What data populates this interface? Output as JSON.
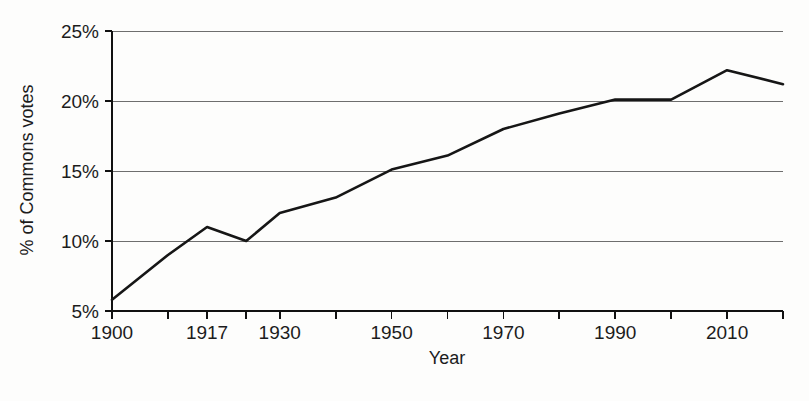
{
  "chart_data": {
    "type": "line",
    "title": "",
    "xlabel": "Year",
    "ylabel": "% of Commons votes",
    "xlim": [
      1900,
      2020
    ],
    "ylim": [
      5,
      25
    ],
    "grid": true,
    "legend": "none",
    "y_ticks": [
      5,
      10,
      15,
      20,
      25
    ],
    "y_tick_labels": [
      "5%",
      "10%",
      "15%",
      "20%",
      "25%"
    ],
    "x_ticks": [
      1900,
      1910,
      1917,
      1924,
      1930,
      1940,
      1950,
      1960,
      1970,
      1980,
      1990,
      2000,
      2010,
      2020
    ],
    "x_tick_labels": [
      "1900",
      "",
      "1917",
      "",
      "1930",
      "",
      "1950",
      "",
      "1970",
      "",
      "1990",
      "",
      "2010",
      ""
    ],
    "x_labeled_ticks": [
      "1900",
      "1917",
      "1930",
      "1950",
      "1970",
      "1990",
      "2010"
    ],
    "series": [
      {
        "name": "% of Commons votes",
        "color": "#161616",
        "x": [
          1900,
          1910,
          1917,
          1924,
          1930,
          1940,
          1950,
          1960,
          1970,
          1980,
          1990,
          2000,
          2010,
          2020
        ],
        "values": [
          5.8,
          9.0,
          11.0,
          10.0,
          12.0,
          13.1,
          15.1,
          16.1,
          18.0,
          19.1,
          20.1,
          20.1,
          22.2,
          21.2
        ]
      }
    ]
  },
  "axes": {
    "y_title": "% of Commons votes",
    "x_title": "Year",
    "y_labels": [
      "25%",
      "20%",
      "15%",
      "10%",
      "5%"
    ],
    "x_labels": [
      "1900",
      "1917",
      "1930",
      "1950",
      "1970",
      "1990",
      "2010"
    ]
  },
  "colors": {
    "line": "#161616",
    "grid": "#6e6e6e",
    "axis": "#111111",
    "background": "#fdfdfc",
    "text": "#1c1c1c"
  }
}
